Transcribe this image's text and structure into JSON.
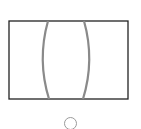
{
  "option": {
    "figure": "lens-diagram",
    "icon": "biconvex-lens-icon",
    "selected": false,
    "colors": {
      "frame": "#222222",
      "lens_curve": "#8a8a8a",
      "radio_border": "#9a9a9a"
    }
  }
}
